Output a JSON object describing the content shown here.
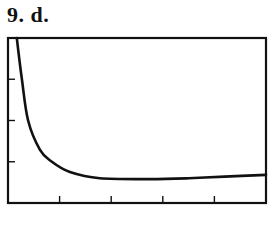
{
  "problem_label": "9.  d.",
  "chart_data": {
    "type": "line",
    "title": "",
    "xlabel": "",
    "ylabel": "",
    "xlim": [
      0,
      5
    ],
    "ylim": [
      0,
      4
    ],
    "x_ticks": [
      1,
      2,
      3,
      4
    ],
    "y_ticks": [
      1,
      2,
      3
    ],
    "tick_labels_shown": false,
    "grid": false,
    "legend": null,
    "series": [
      {
        "name": "curve",
        "x": [
          0.17,
          0.27,
          0.39,
          0.62,
          0.85,
          1.2,
          1.78,
          2.75,
          3.5,
          4.2,
          5.0
        ],
        "y": [
          4.0,
          3.0,
          2.0,
          1.29,
          1.0,
          0.75,
          0.6,
          0.58,
          0.6,
          0.64,
          0.68
        ]
      }
    ],
    "colors": {
      "line": "#111111",
      "frame": "#111111"
    }
  }
}
